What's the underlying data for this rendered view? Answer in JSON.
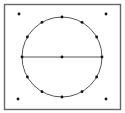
{
  "diagram": {
    "colors": {
      "background": "#ffffff",
      "stroke": "#555555",
      "dot": "#111111",
      "border": "#666666"
    },
    "frame": {
      "x": 4.5,
      "y": 4.5,
      "width": 116,
      "height": 105
    },
    "circle": {
      "cx": 62,
      "cy": 57,
      "r": 40,
      "perimeter_dots": 12
    },
    "diameter": {
      "x1": 22,
      "y1": 57,
      "x2": 102,
      "y2": 57
    },
    "center_dot": {
      "cx": 62,
      "cy": 57
    },
    "corner_dots": [
      {
        "cx": 19,
        "cy": 14
      },
      {
        "cx": 106,
        "cy": 14
      },
      {
        "cx": 18,
        "cy": 99
      },
      {
        "cx": 106,
        "cy": 99
      }
    ],
    "dot_radius": 1.4
  }
}
